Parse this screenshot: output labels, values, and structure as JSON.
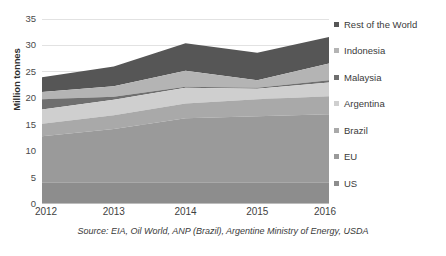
{
  "chart_data": {
    "type": "area",
    "stacked": true,
    "title": "",
    "xlabel": "",
    "ylabel": "Million tonnes",
    "categories": [
      "2012",
      "2013",
      "2014",
      "2015",
      "2016"
    ],
    "x": [
      2012,
      2013,
      2014,
      2015,
      2016
    ],
    "ylim": [
      0,
      35
    ],
    "yticks": [
      0,
      5,
      10,
      15,
      20,
      25,
      30,
      35
    ],
    "grid": true,
    "legend_position": "right",
    "source": "Source: EIA, Oil World, ANP (Brazil), Argentine Ministry of Energy, USDA",
    "series": [
      {
        "name": "US",
        "values": [
          4.0,
          4.0,
          4.0,
          4.0,
          4.0
        ],
        "color": "#8d8d8d"
      },
      {
        "name": "EU",
        "values": [
          8.8,
          10.2,
          12.2,
          12.6,
          13.0
        ],
        "color": "#9a9a9a"
      },
      {
        "name": "Brazil",
        "values": [
          2.4,
          2.6,
          2.8,
          3.2,
          3.4
        ],
        "color": "#a9a9a9"
      },
      {
        "name": "Argentina",
        "values": [
          2.7,
          2.9,
          3.0,
          2.0,
          2.6
        ],
        "color": "#cfcfcf"
      },
      {
        "name": "Malaysia",
        "values": [
          1.9,
          0.6,
          0.2,
          0.2,
          0.4
        ],
        "color": "#6f6f6f"
      },
      {
        "name": "Indonesia",
        "values": [
          1.4,
          2.0,
          3.0,
          1.6,
          3.2
        ],
        "color": "#b4b4b4"
      },
      {
        "name": "Rest of the World",
        "values": [
          2.8,
          3.7,
          5.2,
          5.2,
          5.0
        ],
        "color": "#565656"
      }
    ],
    "cumulative_tops": {
      "US": [
        4.0,
        4.0,
        4.0,
        4.0,
        4.0
      ],
      "EU": [
        12.8,
        14.2,
        16.2,
        16.6,
        17.0
      ],
      "Brazil": [
        15.2,
        16.8,
        19.0,
        19.8,
        20.4
      ],
      "Argentina": [
        17.9,
        19.7,
        22.0,
        21.8,
        23.0
      ],
      "Malaysia": [
        19.8,
        20.3,
        22.2,
        22.0,
        23.4
      ],
      "Indonesia": [
        21.2,
        22.3,
        25.2,
        23.4,
        26.6
      ],
      "Rest of the World": [
        24.0,
        26.0,
        30.4,
        28.6,
        31.6
      ]
    },
    "totals": [
      24.0,
      26.0,
      30.4,
      28.6,
      31.6
    ]
  },
  "axis": {
    "y_title": "Million tonnes",
    "y_tick_labels": [
      "35",
      "30",
      "25",
      "20",
      "15",
      "10",
      "5",
      "0"
    ],
    "x_tick_labels": [
      "2012",
      "2013",
      "2014",
      "2015",
      "2016"
    ]
  },
  "legend": {
    "items": [
      {
        "label": "Rest of the World",
        "color": "#565656"
      },
      {
        "label": "Indonesia",
        "color": "#b4b4b4"
      },
      {
        "label": "Malaysia",
        "color": "#6f6f6f"
      },
      {
        "label": "Argentina",
        "color": "#cfcfcf"
      },
      {
        "label": "Brazil",
        "color": "#a9a9a9"
      },
      {
        "label": "EU",
        "color": "#9a9a9a"
      },
      {
        "label": "US",
        "color": "#8d8d8d"
      }
    ]
  },
  "footer": {
    "source": "Source: EIA, Oil World, ANP (Brazil), Argentine Ministry of Energy, USDA"
  },
  "style": {
    "gridline_color": "#e2e2e2",
    "text_color": "#3a3a3a"
  }
}
